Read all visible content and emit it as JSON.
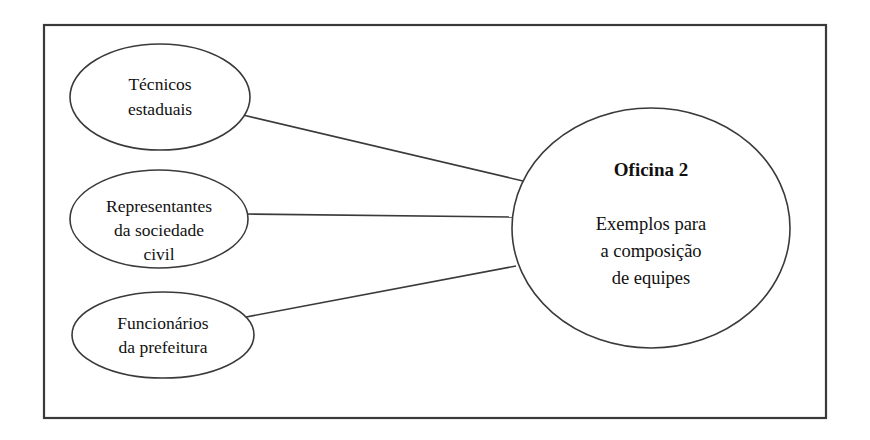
{
  "diagram": {
    "type": "hub-and-spoke",
    "background_color": "#ffffff",
    "stroke_color": "#3a3a3a",
    "text_color": "#111111",
    "frame": {
      "name": "outer-border",
      "x": 44,
      "y": 25,
      "width": 782,
      "height": 393
    },
    "hub": {
      "title": "Oficina 2",
      "body_lines": [
        "Exemplos para",
        "a composição",
        "de equipes"
      ],
      "cx": 651,
      "cy": 228,
      "rx": 139,
      "ry": 120
    },
    "nodes": [
      {
        "id": "tecnicos-estaduais",
        "lines": [
          "Técnicos",
          "estaduais"
        ],
        "cx": 160,
        "cy": 97,
        "rx": 90,
        "ry": 53
      },
      {
        "id": "representantes-sociedade-civil",
        "lines": [
          "Representantes",
          "da sociedade",
          "civil"
        ],
        "cx": 159,
        "cy": 219,
        "rx": 89,
        "ry": 49
      },
      {
        "id": "funcionarios-prefeitura",
        "lines": [
          "Funcionários",
          "da prefeitura"
        ],
        "cx": 163,
        "cy": 335,
        "rx": 91,
        "ry": 43
      }
    ],
    "connectors": [
      {
        "id": "link-tecnicos-to-hub",
        "x1": 243,
        "y1": 115,
        "x2": 523,
        "y2": 181
      },
      {
        "id": "link-representantes-to-hub",
        "x1": 247,
        "y1": 214,
        "x2": 512,
        "y2": 217
      },
      {
        "id": "link-funcionarios-to-hub",
        "x1": 241,
        "y1": 318,
        "x2": 516,
        "y2": 266
      }
    ]
  }
}
